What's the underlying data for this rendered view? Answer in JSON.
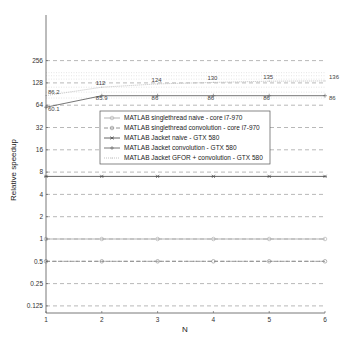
{
  "chart_data": {
    "type": "line",
    "title": "",
    "xlabel": "N",
    "ylabel": "Relative speedup",
    "yscale": "log2",
    "x": [
      1,
      2,
      3,
      4,
      5,
      6
    ],
    "xlim": [
      1,
      6
    ],
    "ylim": [
      0.1,
      512
    ],
    "xticks": [
      "1",
      "2",
      "3",
      "4",
      "5",
      "6"
    ],
    "yticks": [
      "0.125",
      "0.25",
      "0.5",
      "1",
      "2",
      "4",
      "8",
      "16",
      "32",
      "64",
      "128",
      "256"
    ],
    "grid": "dashed horizontal at y ticks",
    "legend_position": "center",
    "series": [
      {
        "name": "MATLAB singlethread naive - core i7-970",
        "values": [
          1,
          1,
          1,
          1,
          1,
          1
        ],
        "marker": "circle",
        "line": "solid"
      },
      {
        "name": "MATLAB singlethread convolution - core i7-970",
        "values": [
          0.5,
          0.5,
          0.5,
          0.5,
          0.5,
          0.5
        ],
        "marker": "circle",
        "line": "dashed"
      },
      {
        "name": "MATLAB Jacket naive - GTX 580",
        "values": [
          7,
          7,
          7,
          7,
          7,
          7
        ],
        "marker": "star",
        "line": "solid"
      },
      {
        "name": "MATLAB Jacket convolution - GTX 580",
        "values": [
          60.1,
          85.9,
          86,
          86,
          86,
          86
        ],
        "marker": "plus",
        "line": "solid",
        "data_labels": [
          "60.1",
          "85.9",
          "86",
          "86",
          "86",
          "86"
        ]
      },
      {
        "name": "MATLAB Jacket GFOR + convolution - GTX 580",
        "values": [
          86.2,
          112,
          124,
          130,
          135,
          136
        ],
        "marker": "point",
        "line": "dotted",
        "data_labels": [
          "86.2",
          "112",
          "124",
          "130",
          "135",
          "136"
        ]
      }
    ]
  }
}
